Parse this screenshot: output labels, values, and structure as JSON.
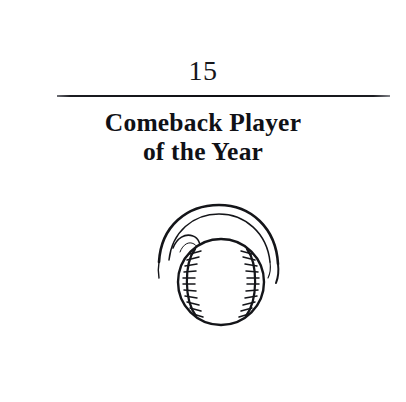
{
  "page": {
    "background_color": "#ffffff",
    "ink_color": "#101116"
  },
  "chapter": {
    "number": "15",
    "title_line_1": "Comeback Player",
    "title_line_2": "of the Year",
    "rule_color": "#0e0f13"
  },
  "illustration": {
    "name": "baseball-with-motion-arcs",
    "description": "Line-art baseball with curved stitched seams and speed arcs sweeping over the top",
    "stroke_color": "#141519",
    "fill_color": "#ffffff",
    "parts": [
      "motion-arc-outer",
      "motion-arc-inner",
      "motion-arc-tail-left",
      "ball-circle",
      "seam-left",
      "seam-right",
      "stitches-left",
      "stitches-right"
    ]
  }
}
